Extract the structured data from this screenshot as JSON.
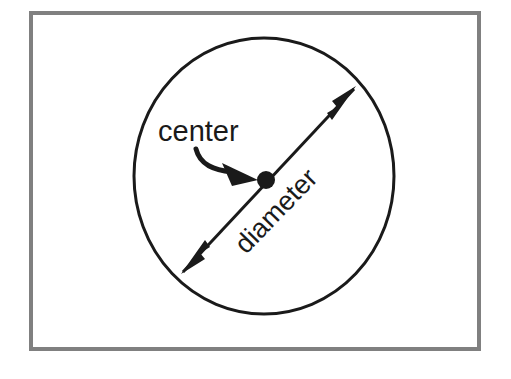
{
  "figure": {
    "type": "geometry-diagram",
    "background_color": "#ffffff",
    "frame": {
      "border_color": "#808080",
      "border_width_px": 4,
      "x": 29,
      "y": 11,
      "width": 452,
      "height": 340
    },
    "stroke_color": "#1a1a1a",
    "shapes": {
      "circle": {
        "name": "circle-outline",
        "center_x": 264,
        "center_y": 176,
        "radius_x": 130,
        "radius_y": 138,
        "stroke_width_px": 3,
        "fill": "none"
      },
      "center_dot": {
        "name": "center-point",
        "cx": 266,
        "cy": 180,
        "r": 9,
        "fill": "#1a1a1a"
      },
      "diameter_arrow": {
        "name": "diameter-double-arrow",
        "x1": 183,
        "y1": 272,
        "x2": 354,
        "y2": 89,
        "stroke_width_px": 3,
        "arrowheads": "both"
      },
      "center_leader": {
        "name": "center-leader-arrow",
        "start_x": 196,
        "start_y": 150,
        "end_x": 256,
        "end_y": 177,
        "stroke_width_px": 5,
        "arrowheads": "end"
      }
    },
    "labels": [
      {
        "id": "center",
        "text": "center",
        "x": 158,
        "y": 141,
        "font_size_px": 29,
        "rotation_deg": 0,
        "anchor": "start"
      },
      {
        "id": "diameter",
        "text": "diameter",
        "x": 246,
        "y": 255,
        "font_size_px": 27,
        "rotation_deg": -46,
        "anchor": "start"
      }
    ]
  }
}
